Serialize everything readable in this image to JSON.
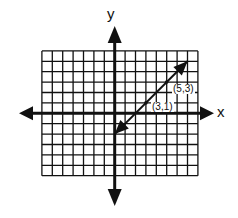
{
  "chart_data": {
    "type": "line",
    "title": "",
    "xlabel": "x",
    "ylabel": "y",
    "xlim": [
      -7,
      8
    ],
    "ylim": [
      -6,
      6
    ],
    "grid": true,
    "legend": null,
    "series": [
      {
        "name": "y = x - 2",
        "x": [
          0,
          3,
          5,
          7
        ],
        "y": [
          -2,
          1,
          3,
          5
        ],
        "arrows_both_ends": true
      }
    ],
    "annotations": [
      {
        "text": "(5,3)",
        "x": 5,
        "y": 3
      },
      {
        "text": "(3,1)",
        "x": 3,
        "y": 1
      }
    ]
  },
  "labels": {
    "x_axis": "x",
    "y_axis": "y",
    "point_a": "(5,3)",
    "point_b": "(3,1)"
  },
  "colors": {
    "ink": "#111111",
    "background": "#ffffff"
  }
}
